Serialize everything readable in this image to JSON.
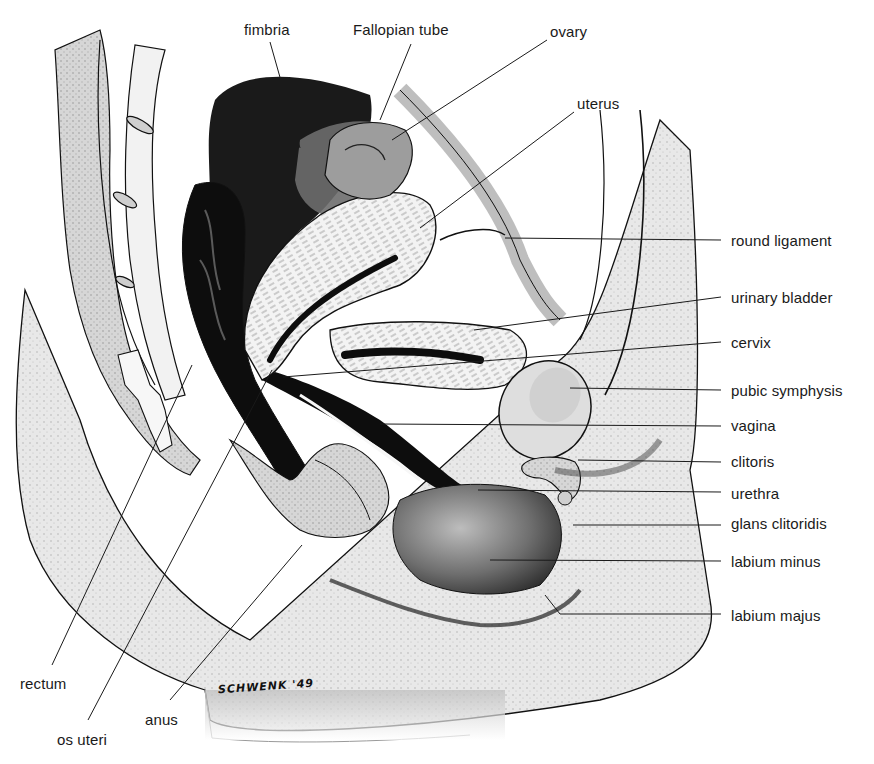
{
  "diagram": {
    "type": "anatomical-illustration",
    "signature": "SCHWENK '49",
    "labels": [
      {
        "id": "fimbria",
        "text": "fimbria",
        "x": 244,
        "y": 22,
        "line": [
          270,
          42,
          300,
          148
        ]
      },
      {
        "id": "fallopian-tube",
        "text": "Fallopian tube",
        "x": 353,
        "y": 22,
        "line": [
          411,
          44,
          380,
          120
        ]
      },
      {
        "id": "ovary",
        "text": "ovary",
        "x": 550,
        "y": 24,
        "line": [
          547,
          40,
          392,
          140
        ]
      },
      {
        "id": "uterus",
        "text": "uterus",
        "x": 577,
        "y": 96,
        "line": [
          574,
          112,
          420,
          228
        ]
      },
      {
        "id": "round-ligament",
        "text": "round ligament",
        "x": 731,
        "y": 233,
        "line": [
          721,
          240,
          505,
          238
        ]
      },
      {
        "id": "urinary-bladder",
        "text": "urinary bladder",
        "x": 731,
        "y": 290,
        "line": [
          721,
          297,
          474,
          330
        ]
      },
      {
        "id": "cervix",
        "text": "cervix",
        "x": 731,
        "y": 335,
        "line": [
          721,
          342,
          283,
          377
        ]
      },
      {
        "id": "pubic-symphysis",
        "text": "pubic symphysis",
        "x": 731,
        "y": 383,
        "line": [
          721,
          390,
          570,
          388
        ]
      },
      {
        "id": "vagina",
        "text": "vagina",
        "x": 731,
        "y": 418,
        "line": [
          721,
          426,
          380,
          424
        ]
      },
      {
        "id": "clitoris",
        "text": "clitoris",
        "x": 731,
        "y": 454,
        "line": [
          721,
          462,
          578,
          460
        ]
      },
      {
        "id": "urethra",
        "text": "urethra",
        "x": 731,
        "y": 486,
        "line": [
          721,
          492,
          478,
          490
        ]
      },
      {
        "id": "glans-clitoridis",
        "text": "glans clitoridis",
        "x": 731,
        "y": 516,
        "line": [
          721,
          525,
          573,
          525
        ]
      },
      {
        "id": "labium-minus",
        "text": "labium minus",
        "x": 731,
        "y": 554,
        "line": [
          721,
          561,
          490,
          560
        ]
      },
      {
        "id": "labium-majus",
        "text": "labium majus",
        "x": 731,
        "y": 608,
        "line": [
          721,
          614,
          560,
          614,
          545,
          595
        ]
      },
      {
        "id": "rectum",
        "text": "rectum",
        "x": 20,
        "y": 676,
        "line": [
          52,
          665,
          192,
          365
        ]
      },
      {
        "id": "anus",
        "text": "anus",
        "x": 145,
        "y": 712,
        "line": [
          170,
          700,
          302,
          545
        ]
      },
      {
        "id": "os-uteri",
        "text": "os uteri",
        "x": 57,
        "y": 732,
        "line": [
          88,
          720,
          272,
          370
        ]
      }
    ]
  }
}
